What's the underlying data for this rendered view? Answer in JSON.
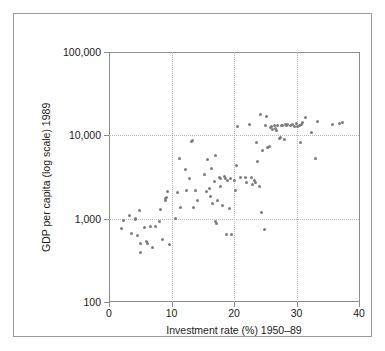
{
  "chart_data": {
    "type": "scatter",
    "title": "",
    "xlabel": "Investment rate (%) 1950–89",
    "ylabel": "GDP per capita (log scale) 1989",
    "xlim": [
      0,
      40
    ],
    "ylim": [
      100,
      100000
    ],
    "yscale": "log",
    "xscale": "linear",
    "grid": "dotted gridlines at x = 10, 20, 30 and y = 1,000 and 10,000",
    "legend": "none",
    "marker_color": "#7d7d7d",
    "xticks": [
      0,
      10,
      20,
      30,
      40
    ],
    "xtick_labels": [
      "0",
      "10",
      "20",
      "30",
      "40"
    ],
    "yticks": [
      100,
      1000,
      10000,
      100000
    ],
    "ytick_labels": [
      "100",
      "1,000",
      "10,000",
      "100,000"
    ],
    "series": [
      {
        "name": "Countries",
        "points": [
          [
            2.0,
            760
          ],
          [
            2.3,
            960
          ],
          [
            3.2,
            1080
          ],
          [
            3.6,
            660
          ],
          [
            4.2,
            1000
          ],
          [
            4.3,
            990
          ],
          [
            4.6,
            620
          ],
          [
            4.8,
            1250
          ],
          [
            5.0,
            505
          ],
          [
            5.1,
            395
          ],
          [
            5.6,
            790
          ],
          [
            6.0,
            525
          ],
          [
            6.2,
            500
          ],
          [
            6.6,
            800
          ],
          [
            6.9,
            455
          ],
          [
            7.4,
            810
          ],
          [
            8.1,
            930
          ],
          [
            8.3,
            1290
          ],
          [
            8.5,
            560
          ],
          [
            9.0,
            1640
          ],
          [
            9.1,
            1740
          ],
          [
            9.2,
            1800
          ],
          [
            9.3,
            2130
          ],
          [
            9.6,
            485
          ],
          [
            10.6,
            1000
          ],
          [
            11.0,
            2050
          ],
          [
            11.2,
            5250
          ],
          [
            11.4,
            1370
          ],
          [
            12.2,
            3850
          ],
          [
            12.4,
            2150
          ],
          [
            12.9,
            3050
          ],
          [
            13.2,
            8400
          ],
          [
            13.4,
            8650
          ],
          [
            13.5,
            1370
          ],
          [
            13.8,
            2180
          ],
          [
            14.2,
            1640
          ],
          [
            15.3,
            3420
          ],
          [
            15.6,
            2100
          ],
          [
            15.8,
            5100
          ],
          [
            16.0,
            2300
          ],
          [
            16.2,
            1860
          ],
          [
            16.4,
            4050
          ],
          [
            16.6,
            1540
          ],
          [
            16.9,
            2780
          ],
          [
            17.0,
            5700
          ],
          [
            17.1,
            930
          ],
          [
            17.2,
            870
          ],
          [
            17.3,
            1650
          ],
          [
            17.6,
            3150
          ],
          [
            17.8,
            3050
          ],
          [
            17.9,
            2400
          ],
          [
            18.2,
            1450
          ],
          [
            18.4,
            3250
          ],
          [
            18.6,
            3000
          ],
          [
            18.8,
            640
          ],
          [
            19.0,
            2850
          ],
          [
            19.2,
            1330
          ],
          [
            19.4,
            3060
          ],
          [
            19.6,
            650
          ],
          [
            20.0,
            2900
          ],
          [
            20.2,
            2170
          ],
          [
            20.4,
            4350
          ],
          [
            20.6,
            12800
          ],
          [
            21.0,
            3100
          ],
          [
            21.8,
            3080
          ],
          [
            22.0,
            2750
          ],
          [
            22.4,
            13400
          ],
          [
            22.8,
            3080
          ],
          [
            23.0,
            2550
          ],
          [
            23.2,
            2850
          ],
          [
            23.4,
            2700
          ],
          [
            23.6,
            8100
          ],
          [
            23.8,
            4900
          ],
          [
            24.0,
            2450
          ],
          [
            24.2,
            17800
          ],
          [
            24.4,
            1200
          ],
          [
            24.6,
            6650
          ],
          [
            24.8,
            740
          ],
          [
            25.0,
            13000
          ],
          [
            25.2,
            16600
          ],
          [
            25.4,
            7200
          ],
          [
            25.6,
            7300
          ],
          [
            25.8,
            12500
          ],
          [
            26.0,
            12700
          ],
          [
            26.2,
            11600
          ],
          [
            26.4,
            13200
          ],
          [
            26.6,
            12000
          ],
          [
            26.8,
            11300
          ],
          [
            27.0,
            13300
          ],
          [
            27.2,
            9100
          ],
          [
            27.4,
            9400
          ],
          [
            27.6,
            13000
          ],
          [
            27.8,
            13300
          ],
          [
            28.0,
            8900
          ],
          [
            28.2,
            13400
          ],
          [
            28.4,
            13300
          ],
          [
            28.6,
            13600
          ],
          [
            29.0,
            13300
          ],
          [
            29.4,
            13500
          ],
          [
            29.6,
            12800
          ],
          [
            30.0,
            13900
          ],
          [
            30.2,
            12700
          ],
          [
            30.4,
            13000
          ],
          [
            30.6,
            8200
          ],
          [
            30.8,
            13600
          ],
          [
            31.0,
            14200
          ],
          [
            31.4,
            16400
          ],
          [
            32.4,
            10700
          ],
          [
            33.0,
            5200
          ],
          [
            33.4,
            14500
          ],
          [
            35.8,
            13400
          ],
          [
            36.8,
            13800
          ],
          [
            37.4,
            14200
          ]
        ]
      }
    ]
  },
  "axes": {
    "x_title": "Investment rate (%) 1950–89",
    "y_title": "GDP per capita (log scale) 1989"
  }
}
